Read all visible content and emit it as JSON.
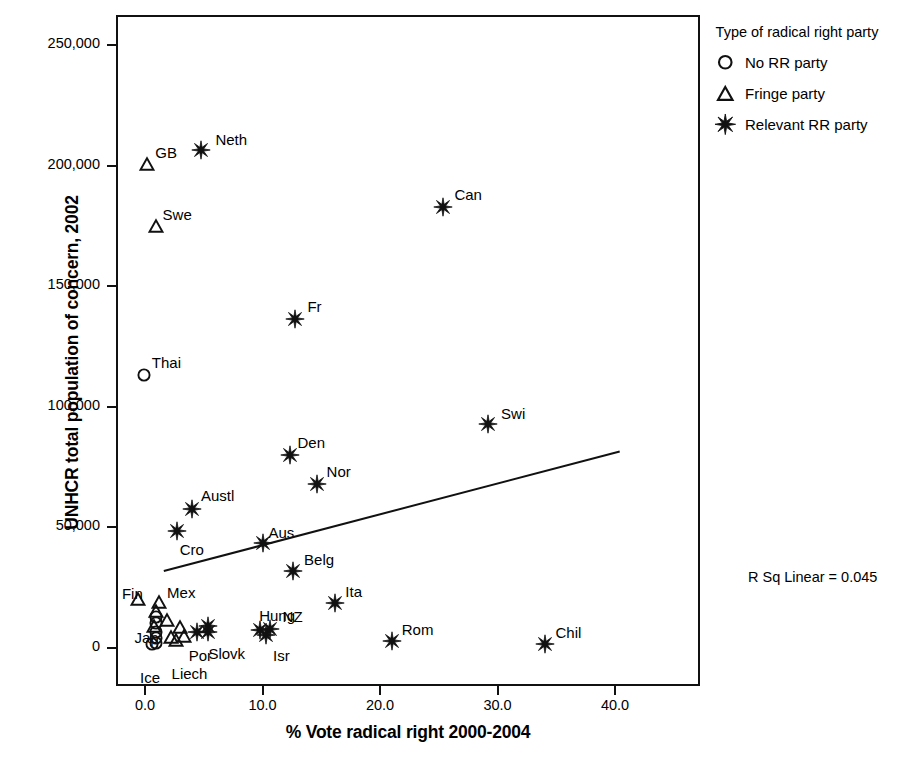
{
  "chart_data": {
    "type": "scatter",
    "title": "",
    "xlabel": "% Vote radical right 2000-2004",
    "ylabel": "UNHCR total population of concern, 2002",
    "xlim": [
      0,
      40
    ],
    "ylim": [
      0,
      250000
    ],
    "xticks": [
      "0.0",
      "10.0",
      "20.0",
      "30.0",
      "40.0"
    ],
    "xtick_values": [
      0,
      10,
      20,
      30,
      40
    ],
    "yticks": [
      "0",
      "50,000",
      "100,000",
      "150,000",
      "200,000",
      "250,000"
    ],
    "ytick_values": [
      0,
      50000,
      100000,
      150000,
      200000,
      250000
    ],
    "grid": false,
    "annotation": "R Sq Linear = 0.045",
    "legend": {
      "title": "Type of radical right party",
      "position": "right-top",
      "entries": [
        {
          "label": "No RR party",
          "marker": "circle"
        },
        {
          "label": "Fringe party",
          "marker": "triangle"
        },
        {
          "label": "Relevant RR party",
          "marker": "star"
        }
      ]
    },
    "fit_line": {
      "type": "linear",
      "r_squared": 0.045,
      "x_start": 1.6,
      "y_start": 31900,
      "x_end": 40.4,
      "y_end": 81500
    },
    "points": [
      {
        "label": "Neth",
        "x": 4.8,
        "y": 206500,
        "marker": "star",
        "label_dx": 14,
        "label_dy": -18
      },
      {
        "label": "GB",
        "x": 0.2,
        "y": 200500,
        "marker": "triangle",
        "label_dx": 8,
        "label_dy": -19
      },
      {
        "label": "Can",
        "x": 25.4,
        "y": 183000,
        "marker": "star",
        "label_dx": 11,
        "label_dy": -20
      },
      {
        "label": "Swe",
        "x": 0.9,
        "y": 175000,
        "marker": "triangle",
        "label_dx": 7,
        "label_dy": -19
      },
      {
        "label": "Fr",
        "x": 12.8,
        "y": 136500,
        "marker": "star",
        "label_dx": 12,
        "label_dy": -20
      },
      {
        "label": "Thai",
        "x": -0.1,
        "y": 113000,
        "marker": "circle",
        "label_dx": 8,
        "label_dy": -20
      },
      {
        "label": "Swi",
        "x": 29.2,
        "y": 93000,
        "marker": "star",
        "label_dx": 13,
        "label_dy": -18
      },
      {
        "label": "Den",
        "x": 12.3,
        "y": 80000,
        "marker": "star",
        "label_dx": 8,
        "label_dy": -20
      },
      {
        "label": "Nor",
        "x": 14.6,
        "y": 68000,
        "marker": "star",
        "label_dx": 10,
        "label_dy": -20
      },
      {
        "label": "Austl",
        "x": 4.0,
        "y": 57500,
        "marker": "star",
        "label_dx": 9,
        "label_dy": -21
      },
      {
        "label": "Cro",
        "x": 2.7,
        "y": 48500,
        "marker": "star",
        "label_dx": 3,
        "label_dy": 11
      },
      {
        "label": "Aus",
        "x": 10.0,
        "y": 43500,
        "marker": "star",
        "label_dx": 6,
        "label_dy": -18
      },
      {
        "label": "Belg",
        "x": 12.6,
        "y": 32000,
        "marker": "star",
        "label_dx": 11,
        "label_dy": -19
      },
      {
        "label": "Ita",
        "x": 16.2,
        "y": 18500,
        "marker": "star",
        "label_dx": 10,
        "label_dy": -19
      },
      {
        "label": "Hung",
        "x": 9.8,
        "y": 7500,
        "marker": "star",
        "label_dx": -1,
        "label_dy": -22
      },
      {
        "label": "NZ",
        "x": 10.6,
        "y": 8000,
        "marker": "star",
        "label_dx": 13,
        "label_dy": -20
      },
      {
        "label": "Isr",
        "x": 10.3,
        "y": 5500,
        "marker": "star",
        "label_dx": 7,
        "label_dy": 13
      },
      {
        "label": "Rom",
        "x": 21.0,
        "y": 3000,
        "marker": "star",
        "label_dx": 10,
        "label_dy": -19
      },
      {
        "label": "Chil",
        "x": 34.0,
        "y": 1500,
        "marker": "star",
        "label_dx": 11,
        "label_dy": -19
      },
      {
        "label": "Slovk",
        "x": 5.4,
        "y": 6500,
        "marker": "star",
        "label_dx": 0,
        "label_dy": 14
      },
      {
        "label": "Fin",
        "x": -0.6,
        "y": 20500,
        "marker": "triangle",
        "label_dx": -16,
        "label_dy": -13
      },
      {
        "label": "Mex",
        "x": 1.2,
        "y": 19000,
        "marker": "triangle",
        "label_dx": 8,
        "label_dy": -17
      },
      {
        "label": "Jap",
        "x": 0.8,
        "y": 9000,
        "marker": "triangle",
        "label_dx": -20,
        "label_dy": 4
      },
      {
        "label": "Por",
        "x": 3.3,
        "y": 5000,
        "marker": "triangle",
        "label_dx": 5,
        "label_dy": 12
      },
      {
        "label": "Liech",
        "x": 2.6,
        "y": 3500,
        "marker": "triangle",
        "label_dx": -4,
        "label_dy": 26
      },
      {
        "label": "Ice",
        "x": 0.6,
        "y": 1500,
        "marker": "circle",
        "label_dx": -12,
        "label_dy": 26
      },
      {
        "label": "",
        "x": 0.9,
        "y": 15500,
        "marker": "triangle",
        "label_dx": 0,
        "label_dy": 0
      },
      {
        "label": "",
        "x": 0.9,
        "y": 13000,
        "marker": "circle",
        "label_dx": 0,
        "label_dy": 0
      },
      {
        "label": "",
        "x": 0.9,
        "y": 10500,
        "marker": "circle",
        "label_dx": 0,
        "label_dy": 0
      },
      {
        "label": "",
        "x": 0.9,
        "y": 6500,
        "marker": "circle",
        "label_dx": 0,
        "label_dy": 0
      },
      {
        "label": "",
        "x": 0.9,
        "y": 4000,
        "marker": "circle",
        "label_dx": 0,
        "label_dy": 0
      },
      {
        "label": "",
        "x": 0.9,
        "y": 2000,
        "marker": "circle",
        "label_dx": 0,
        "label_dy": 0
      },
      {
        "label": "",
        "x": 1.9,
        "y": 11500,
        "marker": "triangle",
        "label_dx": 0,
        "label_dy": 0
      },
      {
        "label": "",
        "x": 3.0,
        "y": 8500,
        "marker": "triangle",
        "label_dx": 0,
        "label_dy": 0
      },
      {
        "label": "",
        "x": 2.2,
        "y": 4500,
        "marker": "triangle",
        "label_dx": 0,
        "label_dy": 0
      },
      {
        "label": "",
        "x": 4.4,
        "y": 6500,
        "marker": "star",
        "label_dx": 0,
        "label_dy": 0
      },
      {
        "label": "",
        "x": 5.4,
        "y": 9000,
        "marker": "star",
        "label_dx": 0,
        "label_dy": 0
      }
    ]
  },
  "colors": {
    "ink": "#111111",
    "background": "#ffffff"
  }
}
